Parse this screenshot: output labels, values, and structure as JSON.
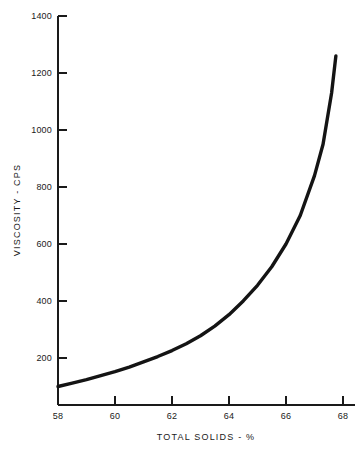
{
  "chart_data": {
    "type": "line",
    "title": "",
    "xlabel": "TOTAL SOLIDS - %",
    "ylabel": "VISCOSITY - CPS",
    "xlim": [
      58,
      68
    ],
    "ylim": [
      35,
      1400
    ],
    "grid": false,
    "legend": null,
    "xticks": [
      58,
      60,
      62,
      64,
      66,
      68
    ],
    "xtick_labels": [
      "58",
      "60",
      "62",
      "64",
      "66",
      "68"
    ],
    "yticks": [
      200,
      400,
      600,
      800,
      1000,
      1200,
      1400
    ],
    "ytick_labels": [
      "200",
      "400",
      "600",
      "800",
      "1000",
      "1200",
      "1400"
    ],
    "series": [
      {
        "name": "viscosity",
        "color": "#141414",
        "x": [
          58.0,
          58.5,
          59.0,
          59.5,
          60.0,
          60.5,
          61.0,
          61.5,
          62.0,
          62.5,
          63.0,
          63.5,
          64.0,
          64.5,
          65.0,
          65.5,
          66.0,
          66.5,
          67.0,
          67.3,
          67.6,
          67.75
        ],
        "values": [
          100,
          112,
          124,
          138,
          152,
          168,
          186,
          205,
          226,
          250,
          278,
          312,
          352,
          400,
          455,
          520,
          600,
          700,
          840,
          950,
          1130,
          1260
        ]
      }
    ]
  },
  "axis": {
    "y_title": "VISCOSITY - CPS",
    "x_title": "TOTAL SOLIDS - %"
  },
  "geometry": {
    "plot_left": 58,
    "plot_right": 355,
    "plot_top": 16,
    "plot_bottom": 405,
    "x_min": 58,
    "x_max": 68,
    "x_px_per_unit": 28.5,
    "y_value_at_bottom": 35,
    "y_px_per_200": 57
  }
}
